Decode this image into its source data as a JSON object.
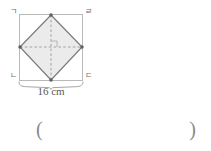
{
  "figure": {
    "outer_shape_name": "square",
    "inner_shape_name": "rhombus",
    "vertex_labels": {
      "top_left": "ㄱ",
      "top_right": "ㄹ",
      "bottom_left": "ㄴ",
      "bottom_right": "ㄷ"
    },
    "dimension_label": "16 cm",
    "dimension_value": 16,
    "dimension_unit": "cm",
    "colors": {
      "outer_stroke": "#b9b9b9",
      "inner_stroke": "#7a7a7a",
      "inner_fill": "#ebebeb",
      "dashed_line": "#9a9a9a",
      "brace": "#9a9a9a",
      "label_text": "#6e6e6e"
    },
    "marks": {
      "right_angle_at_center": true,
      "diagonals_dashed": true,
      "vertex_dots": 4
    }
  },
  "answer": {
    "open_paren": "(",
    "close_paren": ")",
    "value": "",
    "placeholder": ""
  }
}
